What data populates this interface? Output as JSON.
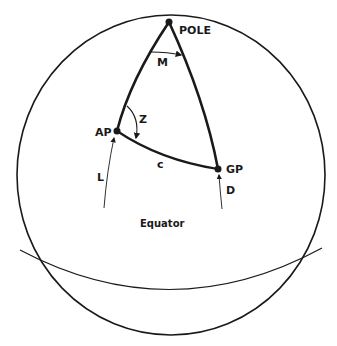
{
  "diagram": {
    "type": "navigational-triangle",
    "labels": {
      "pole": "POLE",
      "meridian_angle": "M",
      "azimuth_angle": "Z",
      "assumed_position": "AP",
      "geographic_position": "GP",
      "distance_arc": "c",
      "latitude": "L",
      "declination": "D",
      "equator": "Equator"
    },
    "colors": {
      "stroke": "#1a1a1a",
      "background": "#ffffff"
    }
  }
}
